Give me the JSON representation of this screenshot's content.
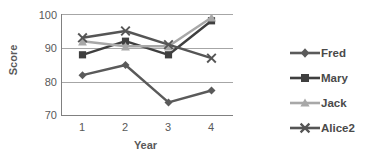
{
  "chart_data": {
    "type": "line",
    "title": "",
    "xlabel": "Year",
    "ylabel": "Score",
    "categories": [
      "1",
      "2",
      "3",
      "4"
    ],
    "xticklabels": [
      "1",
      "2",
      "3",
      "4"
    ],
    "yticklabels": [
      "70",
      "80",
      "90",
      "100"
    ],
    "ylim": [
      70,
      100
    ],
    "ytick_values": [
      70,
      80,
      90,
      100
    ],
    "grid": "horizontal",
    "legend_position": "right",
    "series": [
      {
        "name": "Fred",
        "values": [
          82,
          85,
          74,
          77.5
        ],
        "marker": "diamond",
        "color": "#5a5a5a"
      },
      {
        "name": "Mary",
        "values": [
          88,
          92,
          88,
          98
        ],
        "marker": "square",
        "color": "#3f3f3f"
      },
      {
        "name": "Jack",
        "values": [
          92,
          90.5,
          90.5,
          99
        ],
        "marker": "triangle",
        "color": "#a8a8a8"
      },
      {
        "name": "Alice2",
        "values": [
          93,
          95,
          91,
          87
        ],
        "marker": "cross",
        "color": "#555555"
      }
    ]
  },
  "axes": {
    "ylabel": "Score",
    "xlabel": "Year",
    "ytick_0": "70",
    "ytick_1": "80",
    "ytick_2": "90",
    "ytick_3": "100",
    "xtick_0": "1",
    "xtick_1": "2",
    "xtick_2": "3",
    "xtick_3": "4"
  },
  "legend": {
    "items": [
      {
        "label": "Fred",
        "marker": "diamond-marker-icon"
      },
      {
        "label": "Mary",
        "marker": "square-marker-icon"
      },
      {
        "label": "Jack",
        "marker": "triangle-marker-icon"
      },
      {
        "label": "Alice2",
        "marker": "cross-marker-icon"
      }
    ]
  },
  "colors": {
    "axis": "#808080",
    "grid": "#a6a6a6",
    "text": "#595959",
    "fred": "#5a5a5a",
    "mary": "#3f3f3f",
    "jack": "#a8a8a8",
    "alice2": "#555555",
    "background": "#ffffff"
  }
}
